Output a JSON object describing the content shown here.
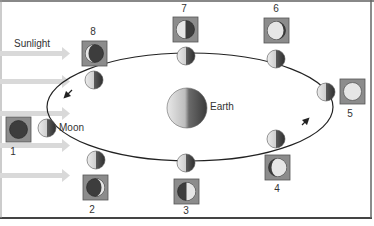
{
  "diagram": {
    "labels": {
      "sunlight": "Sunlight",
      "earth": "Earth",
      "moon": "Moon"
    },
    "colors": {
      "background": "#ffffff",
      "sunlight_arrow": "#d9d9d9",
      "orbit": "#222222",
      "box_fill": "#8c8c8c",
      "box_border": "#555555",
      "lit": "#e6e6e6",
      "dark": "#3d3d3d",
      "frame": "#444444"
    },
    "phases": [
      {
        "number": "1",
        "phase": "new"
      },
      {
        "number": "2",
        "phase": "waxing crescent"
      },
      {
        "number": "3",
        "phase": "first quarter"
      },
      {
        "number": "4",
        "phase": "waxing gibbous"
      },
      {
        "number": "5",
        "phase": "full"
      },
      {
        "number": "6",
        "phase": "waning gibbous"
      },
      {
        "number": "7",
        "phase": "last quarter"
      },
      {
        "number": "8",
        "phase": "waning crescent"
      }
    ]
  }
}
